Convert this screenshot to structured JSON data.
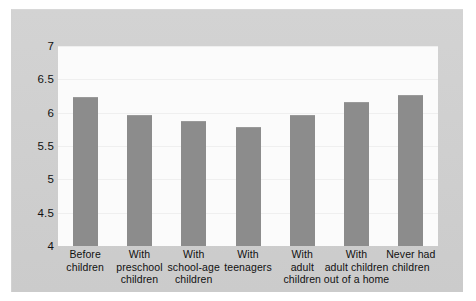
{
  "chart_data": {
    "type": "bar",
    "title": "",
    "subtitle": "",
    "xlabel": "",
    "ylabel": "",
    "ylim": [
      4,
      7
    ],
    "grid": true,
    "legend": "none",
    "yticks": [
      "7",
      "6.5",
      "6",
      "5.5",
      "5",
      "4.5",
      "4"
    ],
    "ytick_values": [
      7,
      6.5,
      6,
      5.5,
      5,
      4.5,
      4
    ],
    "categories": [
      "Before children",
      "With preschool children",
      "With school-age children",
      "With teenagers",
      "With adult children",
      "With adult children out of a home",
      "Never had children"
    ],
    "category_lines": [
      [
        "Before",
        "children"
      ],
      [
        "With",
        "preschool",
        "children"
      ],
      [
        "With",
        "school-age",
        "children"
      ],
      [
        "With",
        "teenagers"
      ],
      [
        "With",
        "adult",
        "children"
      ],
      [
        "With",
        "adult children",
        "out of a home"
      ],
      [
        "Never had",
        "children"
      ]
    ],
    "values": [
      6.23,
      5.96,
      5.88,
      5.78,
      5.96,
      6.16,
      6.27
    ],
    "series": [
      {
        "name": "Marital satisfaction",
        "values": [
          6.23,
          5.96,
          5.88,
          5.78,
          5.96,
          6.16,
          6.27
        ]
      }
    ],
    "colors": {
      "bar": "#8c8c8c",
      "plot_background": "#fbfbfb",
      "figure_background": "#cbcbcb",
      "gridline": "#efefef",
      "text": "#111111"
    }
  }
}
